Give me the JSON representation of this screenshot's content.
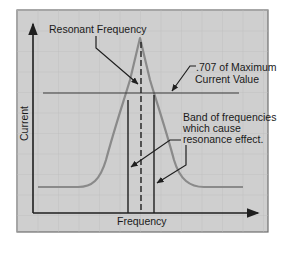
{
  "diagram": {
    "labels": {
      "resonant_frequency": "Resonant Frequency",
      "point_707_line1": ".707 of Maximum",
      "point_707_line2": "Current Value",
      "band_line1": "Band of frequencies",
      "band_line2": "which cause",
      "band_line3": "resonance effect.",
      "x_axis": "Frequency",
      "y_axis": "Current"
    },
    "colors": {
      "background": "#cfcfcf",
      "grid": "#bdbdbd",
      "curve": "#8a8a8a",
      "lines": "#1f1f1f",
      "frame": "#6e6e6e"
    }
  }
}
